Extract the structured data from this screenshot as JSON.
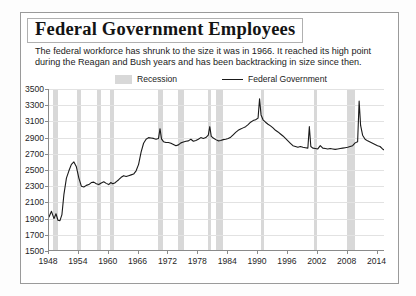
{
  "header": {
    "title": "Federal Government Employees",
    "subtitle_line1": "The federal workforce has shrunk to the size it was in 1966.  It reached its high point",
    "subtitle_line2": "during the Reagan and Bush years and has been backtracking in size since then."
  },
  "legend": {
    "recession_label": "Recession",
    "federal_label": "Federal Government",
    "recession_color": "#d8d8d8",
    "line_color": "#1a1a1a"
  },
  "chart_data": {
    "type": "line",
    "title": "Federal Government Employees",
    "subtitle": "The federal workforce has shrunk to the size it was in 1966.  It reached its high point during the Reagan and Bush years and has been backtracking in size since then.",
    "xlabel": "",
    "ylabel": "",
    "units": "thousands of employees",
    "xlim": [
      1948,
      2015.5
    ],
    "ylim": [
      1500,
      3500
    ],
    "yticks": [
      1500,
      1700,
      1900,
      2100,
      2300,
      2500,
      2700,
      2900,
      3100,
      3300,
      3500
    ],
    "xticks": [
      1948,
      1954,
      1960,
      1966,
      1972,
      1978,
      1984,
      1990,
      1996,
      2002,
      2008,
      2014
    ],
    "grid": true,
    "grid_axis": "y",
    "legend_position": "above-plot",
    "series": [
      {
        "name": "Federal Government",
        "color": "#1a1a1a",
        "x": [
          1948.0,
          1948.5,
          1949.0,
          1949.4,
          1949.8,
          1950.2,
          1950.6,
          1951.0,
          1951.5,
          1952.0,
          1952.5,
          1953.0,
          1953.5,
          1954.0,
          1954.5,
          1955.0,
          1955.5,
          1956.0,
          1956.5,
          1957.0,
          1957.5,
          1958.0,
          1958.5,
          1959.0,
          1959.5,
          1960.0,
          1960.4,
          1960.8,
          1961.2,
          1961.6,
          1962.0,
          1962.5,
          1963.0,
          1963.5,
          1964.0,
          1964.5,
          1965.0,
          1965.5,
          1966.0,
          1966.5,
          1967.0,
          1967.5,
          1968.0,
          1968.5,
          1969.0,
          1969.5,
          1970.0,
          1970.3,
          1970.6,
          1971.0,
          1971.5,
          1972.0,
          1972.5,
          1973.0,
          1973.5,
          1974.0,
          1974.5,
          1975.0,
          1975.5,
          1976.0,
          1976.5,
          1977.0,
          1977.5,
          1978.0,
          1978.5,
          1979.0,
          1979.5,
          1980.0,
          1980.3,
          1980.6,
          1981.0,
          1981.5,
          1982.0,
          1982.5,
          1983.0,
          1983.5,
          1984.0,
          1984.5,
          1985.0,
          1985.5,
          1986.0,
          1986.5,
          1987.0,
          1987.5,
          1988.0,
          1988.5,
          1989.0,
          1989.5,
          1990.0,
          1990.3,
          1990.6,
          1991.0,
          1991.5,
          1992.0,
          1992.5,
          1993.0,
          1993.5,
          1994.0,
          1994.5,
          1995.0,
          1995.5,
          1996.0,
          1996.5,
          1997.0,
          1997.5,
          1998.0,
          1998.5,
          1999.0,
          1999.5,
          2000.0,
          2000.3,
          2000.6,
          2001.0,
          2001.5,
          2002.0,
          2002.5,
          2003.0,
          2003.5,
          2004.0,
          2004.5,
          2005.0,
          2005.5,
          2006.0,
          2006.5,
          2007.0,
          2007.5,
          2008.0,
          2008.5,
          2009.0,
          2009.5,
          2010.0,
          2010.3,
          2010.6,
          2011.0,
          2011.5,
          2012.0,
          2012.5,
          2013.0,
          2013.5,
          2014.0,
          2014.5,
          2015.0,
          2015.4
        ],
        "y": [
          1920,
          1990,
          1900,
          1960,
          1880,
          1875,
          1950,
          2200,
          2400,
          2490,
          2570,
          2600,
          2540,
          2400,
          2300,
          2290,
          2310,
          2320,
          2345,
          2350,
          2330,
          2320,
          2340,
          2355,
          2335,
          2320,
          2345,
          2330,
          2340,
          2360,
          2380,
          2410,
          2430,
          2420,
          2430,
          2440,
          2450,
          2490,
          2570,
          2720,
          2830,
          2880,
          2900,
          2895,
          2890,
          2880,
          2890,
          3010,
          2885,
          2850,
          2840,
          2840,
          2830,
          2815,
          2800,
          2810,
          2835,
          2845,
          2855,
          2860,
          2880,
          2855,
          2865,
          2880,
          2900,
          2890,
          2900,
          2930,
          3035,
          2915,
          2895,
          2875,
          2860,
          2865,
          2875,
          2880,
          2890,
          2905,
          2935,
          2965,
          2990,
          3005,
          3020,
          3035,
          3060,
          3090,
          3110,
          3120,
          3140,
          3380,
          3180,
          3120,
          3090,
          3065,
          3045,
          3020,
          2990,
          2970,
          2945,
          2920,
          2890,
          2860,
          2830,
          2800,
          2790,
          2780,
          2790,
          2780,
          2775,
          2770,
          3035,
          2790,
          2770,
          2765,
          2760,
          2800,
          2770,
          2765,
          2760,
          2765,
          2760,
          2755,
          2760,
          2765,
          2770,
          2775,
          2780,
          2790,
          2800,
          2835,
          2850,
          3350,
          3050,
          2930,
          2880,
          2860,
          2845,
          2830,
          2815,
          2800,
          2790,
          2760,
          2745
        ]
      }
    ],
    "recession_bands": [
      {
        "start": 1948.9,
        "end": 1949.8
      },
      {
        "start": 1953.6,
        "end": 1954.4
      },
      {
        "start": 1957.6,
        "end": 1958.4
      },
      {
        "start": 1960.3,
        "end": 1961.1
      },
      {
        "start": 1969.9,
        "end": 1970.9
      },
      {
        "start": 1973.9,
        "end": 1975.2
      },
      {
        "start": 1980.0,
        "end": 1980.6
      },
      {
        "start": 1981.5,
        "end": 1982.9
      },
      {
        "start": 1990.6,
        "end": 1991.2
      },
      {
        "start": 2001.2,
        "end": 2001.9
      },
      {
        "start": 2007.9,
        "end": 2009.5
      }
    ]
  }
}
